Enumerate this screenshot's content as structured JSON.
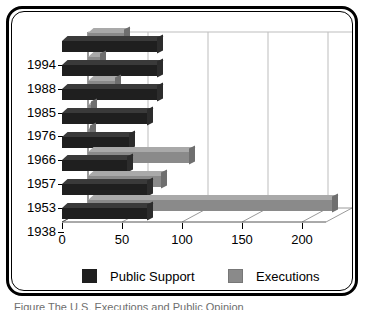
{
  "chart_data": {
    "type": "bar",
    "orientation": "horizontal",
    "title": "",
    "subtitle": "",
    "xlabel": "",
    "ylabel": "",
    "categories": [
      "1994",
      "1988",
      "1985",
      "1976",
      "1966",
      "1957",
      "1953",
      "1938"
    ],
    "series": [
      {
        "name": "Public Support",
        "color": "#1f1f1f",
        "values": [
          80,
          80,
          80,
          72,
          57,
          55,
          72,
          72
        ]
      },
      {
        "name": "Executions",
        "color": "#8a8a8a",
        "values": [
          31,
          11,
          23,
          3,
          1,
          85,
          62,
          204
        ]
      }
    ],
    "xlim": [
      0,
      220
    ],
    "xticks": [
      0,
      50,
      100,
      150,
      200
    ],
    "xtick_labels": [
      "0",
      "50",
      "100",
      "150",
      "200"
    ],
    "grid": true,
    "legend_position": "bottom",
    "style_3d": true
  },
  "legend": {
    "items": [
      {
        "label": "Public Support",
        "color": "#1f1f1f",
        "swatch": "dark"
      },
      {
        "label": "Executions",
        "color": "#8a8a8a",
        "swatch": "gray"
      }
    ]
  },
  "caption": {
    "text": "Figure  The U.S. Executions and Public Opinion"
  },
  "colors": {
    "public_support": "#1f1f1f",
    "executions": "#8a8a8a",
    "frame": "#000000",
    "background": "#ffffff"
  }
}
